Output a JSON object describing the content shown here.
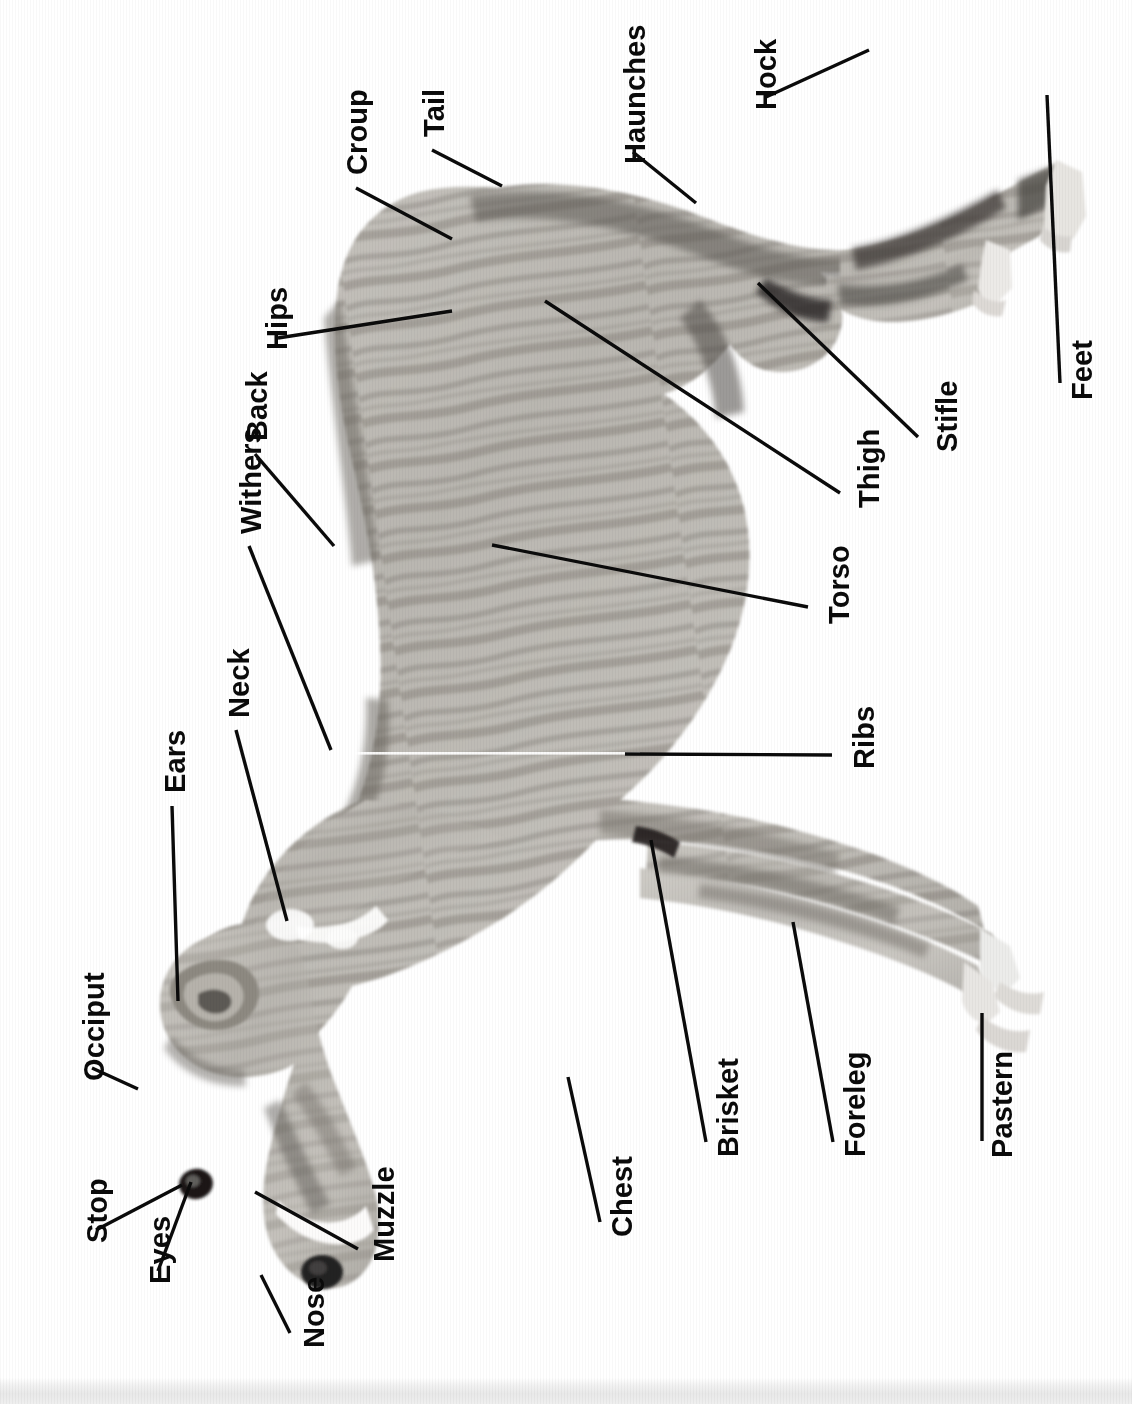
{
  "figure": {
    "orientation": "rotated-90-ccw",
    "background_color": "#ffffff",
    "label_color": "#0a0a0a",
    "leader_color": "#0b0b0b",
    "coat_description": "brindle sighthound in left profile",
    "scan_edge_color": "#e9e9e9"
  },
  "labels": [
    {
      "id": "tail",
      "text": "Tail",
      "x": 420,
      "y": 137,
      "line": {
        "x1": 432,
        "y1": 150,
        "x2": 502,
        "y2": 186
      }
    },
    {
      "id": "croup",
      "text": "Croup",
      "x": 343,
      "y": 175,
      "line": {
        "x1": 356,
        "y1": 188,
        "x2": 452,
        "y2": 239
      }
    },
    {
      "id": "hips",
      "text": "Hips",
      "x": 263,
      "y": 350,
      "line": {
        "x1": 278,
        "y1": 338,
        "x2": 452,
        "y2": 311
      }
    },
    {
      "id": "back",
      "text": "Back",
      "x": 243,
      "y": 441,
      "line": {
        "x1": 255,
        "y1": 454,
        "x2": 334,
        "y2": 546
      }
    },
    {
      "id": "withers",
      "text": "Withers",
      "x": 237,
      "y": 534,
      "line": {
        "x1": 249,
        "y1": 546,
        "x2": 331,
        "y2": 750
      }
    },
    {
      "id": "neck",
      "text": "Neck",
      "x": 225,
      "y": 718,
      "line": {
        "x1": 236,
        "y1": 730,
        "x2": 287,
        "y2": 921
      }
    },
    {
      "id": "ears",
      "text": "Ears",
      "x": 161,
      "y": 793,
      "line": {
        "x1": 172,
        "y1": 806,
        "x2": 178,
        "y2": 1001
      }
    },
    {
      "id": "occiput",
      "text": "Occiput",
      "x": 80,
      "y": 1081,
      "line": {
        "x1": 92,
        "y1": 1068,
        "x2": 138,
        "y2": 1089
      }
    },
    {
      "id": "stop",
      "text": "Stop",
      "x": 83,
      "y": 1243,
      "line": {
        "x1": 96,
        "y1": 1230,
        "x2": 182,
        "y2": 1185
      }
    },
    {
      "id": "eyes",
      "text": "Eyes",
      "x": 146,
      "y": 1284,
      "line": {
        "x1": 158,
        "y1": 1271,
        "x2": 191,
        "y2": 1182
      }
    },
    {
      "id": "nose",
      "text": "Nose",
      "x": 300,
      "y": 1348,
      "line": {
        "x1": 290,
        "y1": 1333,
        "x2": 261,
        "y2": 1275
      }
    },
    {
      "id": "muzzle",
      "text": "Muzzle",
      "x": 370,
      "y": 1262,
      "line": {
        "x1": 358,
        "y1": 1249,
        "x2": 255,
        "y2": 1192
      }
    },
    {
      "id": "chest",
      "text": "Chest",
      "x": 608,
      "y": 1237,
      "line": {
        "x1": 600,
        "y1": 1222,
        "x2": 568,
        "y2": 1077
      }
    },
    {
      "id": "brisket",
      "text": "Brisket",
      "x": 714,
      "y": 1157,
      "line": {
        "x1": 706,
        "y1": 1142,
        "x2": 651,
        "y2": 840
      }
    },
    {
      "id": "foreleg",
      "text": "Foreleg",
      "x": 841,
      "y": 1157,
      "line": {
        "x1": 833,
        "y1": 1142,
        "x2": 793,
        "y2": 922
      }
    },
    {
      "id": "pastern",
      "text": "Pastern",
      "x": 988,
      "y": 1158,
      "line": {
        "x1": 982,
        "y1": 1141,
        "x2": 982,
        "y2": 1013
      }
    },
    {
      "id": "ribs",
      "text": "Ribs",
      "x": 850,
      "y": 769,
      "line": {
        "x1": 832,
        "y1": 755,
        "x2": 625,
        "y2": 754
      }
    },
    {
      "id": "torso",
      "text": "Torso",
      "x": 825,
      "y": 624,
      "line": {
        "x1": 808,
        "y1": 607,
        "x2": 492,
        "y2": 545
      }
    },
    {
      "id": "thigh",
      "text": "Thigh",
      "x": 855,
      "y": 508,
      "line": {
        "x1": 840,
        "y1": 493,
        "x2": 545,
        "y2": 301
      }
    },
    {
      "id": "stifle",
      "text": "Stifle",
      "x": 933,
      "y": 452,
      "line": {
        "x1": 918,
        "y1": 437,
        "x2": 758,
        "y2": 283
      }
    },
    {
      "id": "haunches",
      "text": "Haunches",
      "x": 621,
      "y": 164,
      "line": {
        "x1": 633,
        "y1": 152,
        "x2": 696,
        "y2": 203
      }
    },
    {
      "id": "hock",
      "text": "Hock",
      "x": 752,
      "y": 110,
      "line": {
        "x1": 766,
        "y1": 97,
        "x2": 869,
        "y2": 50
      }
    },
    {
      "id": "feet",
      "text": "Feet",
      "x": 1068,
      "y": 400,
      "line": {
        "x1": 1060,
        "y1": 383,
        "x2": 1047,
        "y2": 95
      }
    }
  ]
}
